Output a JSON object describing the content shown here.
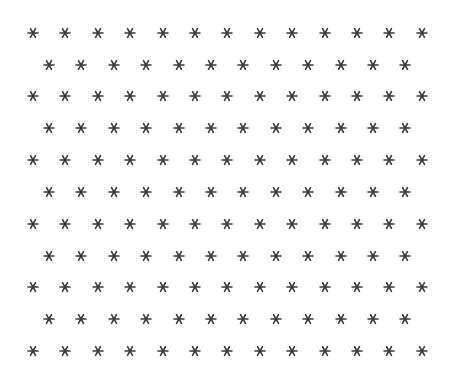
{
  "pattern": {
    "glyph": "asterisk",
    "icon": "asterisk-icon",
    "color": "#3a3a3a",
    "background": "#ffffff",
    "rows": 11,
    "odd_row_count": 13,
    "even_row_count": 12,
    "odd_row_start_x": 33,
    "even_row_start_x": 49,
    "col_spacing": 32.4,
    "row_y": [
      33,
      65,
      96,
      128,
      160,
      192,
      224,
      256,
      287,
      319,
      351
    ]
  }
}
